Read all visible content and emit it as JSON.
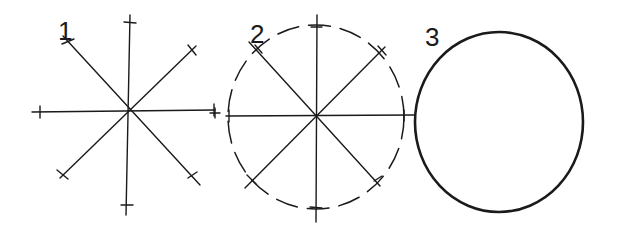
{
  "diagram": {
    "steps": [
      {
        "label": "1",
        "title": "Draw crossing guide lines with tick marks at equal radius",
        "center": [
          128,
          112
        ],
        "lines": [
          [
            [
              130,
              15
            ],
            [
              126,
              215
            ]
          ],
          [
            [
              32,
              112
            ],
            [
              215,
              110
            ]
          ],
          [
            [
              65,
              38
            ],
            [
              198,
              183
            ]
          ],
          [
            [
              193,
              48
            ],
            [
              62,
              176
            ]
          ]
        ]
      },
      {
        "label": "2",
        "title": "Connect the tick marks with a light dashed arc",
        "center": [
          314,
          116
        ],
        "radius": 88,
        "lines": [
          [
            [
              317,
              15
            ],
            [
              316,
              222
            ]
          ],
          [
            [
              228,
              116
            ],
            [
              413,
              115
            ]
          ],
          [
            [
              249,
              42
            ],
            [
              380,
              186
            ]
          ],
          [
            [
              385,
              47
            ],
            [
              248,
              186
            ]
          ]
        ]
      },
      {
        "label": "3",
        "title": "Darken the final circle",
        "center": [
          499,
          122
        ],
        "rx": 84,
        "ry": 90
      }
    ],
    "stroke_color": "#1a1a1a",
    "background": "#ffffff"
  }
}
